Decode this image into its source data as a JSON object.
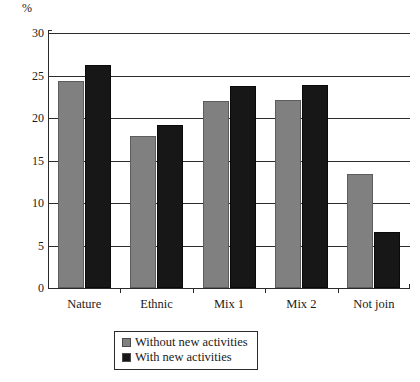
{
  "chart_data": {
    "type": "bar",
    "title": "",
    "xlabel": "",
    "ylabel": "%",
    "ylim": [
      0,
      30
    ],
    "yticks": [
      0,
      5,
      10,
      15,
      20,
      25,
      30
    ],
    "grid": true,
    "legend_position": "bottom-center",
    "categories": [
      "Nature",
      "Ethnic",
      "Mix 1",
      "Mix 2",
      "Not join"
    ],
    "series": [
      {
        "name": "Without new activities",
        "color": "#808080",
        "values": [
          24.3,
          17.9,
          22.0,
          22.1,
          13.4
        ]
      },
      {
        "name": "With new activities",
        "color": "#171717",
        "values": [
          26.2,
          19.2,
          23.8,
          23.9,
          6.6
        ]
      }
    ]
  },
  "axis": {
    "unit_label": "%"
  },
  "legend": {
    "entries": [
      {
        "label": "Without new activities",
        "swatch": "gray"
      },
      {
        "label": "With new activities",
        "swatch": "black"
      }
    ]
  }
}
